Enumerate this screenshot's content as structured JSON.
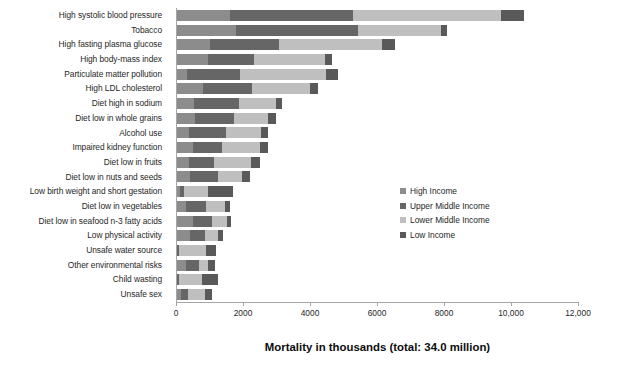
{
  "chart_data": {
    "type": "bar",
    "orientation": "horizontal",
    "stacked": true,
    "title": "",
    "xlabel": "Mortality in thousands (total: 34.0 million)",
    "ylabel": "",
    "xlim": [
      0,
      12000
    ],
    "xticks": [
      0,
      2000,
      4000,
      6000,
      8000,
      10000,
      12000
    ],
    "xtick_labels": [
      "0",
      "2000",
      "4000",
      "6000",
      "8000",
      "10,000",
      "12,000"
    ],
    "grid": false,
    "legend_position": "center-right",
    "categories": [
      "High systolic blood pressure",
      "Tobacco",
      "High fasting plasma glucose",
      "High body-mass index",
      "Particulate matter pollution",
      "High LDL cholesterol",
      "Diet high in sodium",
      "Diet low in whole grains",
      "Alcohol use",
      "Impaired kidney function",
      "Diet low in fruits",
      "Diet low in nuts and seeds",
      "Low birth weight and short gestation",
      "Diet low in vegetables",
      "Diet low in seafood n-3 fatty acids",
      "Low physical activity",
      "Unsafe water source",
      "Other environmental risks",
      "Child wasting",
      "Unsafe sex"
    ],
    "series": [
      {
        "name": "High Income",
        "color": "#8c8c8c",
        "values": [
          1620,
          1800,
          1000,
          970,
          330,
          800,
          530,
          560,
          400,
          510,
          390,
          430,
          120,
          300,
          500,
          430,
          40,
          300,
          30,
          140
        ]
      },
      {
        "name": "Upper Middle Income",
        "color": "#666666",
        "values": [
          3660,
          3630,
          2070,
          1370,
          1570,
          1480,
          1350,
          1180,
          1080,
          850,
          740,
          830,
          110,
          610,
          560,
          440,
          60,
          390,
          60,
          210
        ]
      },
      {
        "name": "Lower Middle Income",
        "color": "#bfbfbf",
        "values": [
          4420,
          2470,
          3080,
          2120,
          2570,
          1710,
          1120,
          1020,
          1060,
          1140,
          1120,
          700,
          740,
          540,
          450,
          390,
          810,
          280,
          690,
          510
        ]
      },
      {
        "name": "Low Income",
        "color": "#595959",
        "values": [
          700,
          200,
          400,
          190,
          360,
          260,
          150,
          240,
          210,
          250,
          250,
          240,
          740,
          150,
          120,
          140,
          290,
          180,
          470,
          220
        ]
      }
    ],
    "totals": [
      10400,
      8100,
      6550,
      4650,
      4830,
      4250,
      3150,
      3000,
      2750,
      2750,
      2500,
      2200,
      1710,
      1600,
      1630,
      1400,
      1200,
      1150,
      1250,
      1080
    ]
  },
  "legend": {
    "items": [
      {
        "label": "High Income",
        "color": "#8c8c8c"
      },
      {
        "label": "Upper Middle Income",
        "color": "#666666"
      },
      {
        "label": "Lower Middle Income",
        "color": "#bfbfbf"
      },
      {
        "label": "Low Income",
        "color": "#595959"
      }
    ]
  },
  "axis": {
    "x_title": "Mortality in thousands (total: 34.0 million)"
  }
}
